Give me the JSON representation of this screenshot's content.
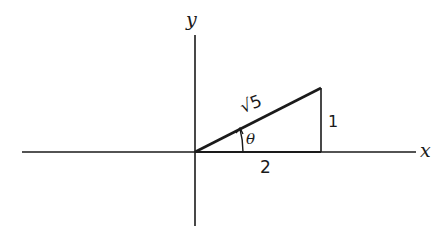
{
  "diagram": {
    "type": "right-triangle-on-axes",
    "axes": {
      "x_label": "x",
      "y_label": "y"
    },
    "triangle": {
      "hypotenuse_label": "√5",
      "opposite_label": "1",
      "adjacent_label": "2",
      "angle_label": "θ"
    },
    "colors": {
      "ink": "#1a1a1a",
      "background": "#ffffff"
    }
  }
}
